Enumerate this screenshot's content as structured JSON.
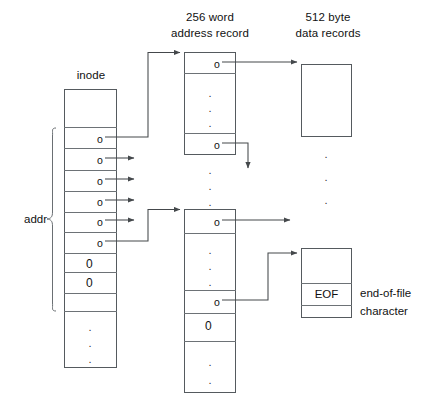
{
  "diagram": {
    "headers": {
      "inode": "inode",
      "address_record_line1": "256 word",
      "address_record_line2": "address record",
      "data_record_line1": "512 byte",
      "data_record_line2": "data records"
    },
    "annotations": {
      "addr_brace_label": "addr",
      "eof_cell": "EOF",
      "eof_note_line1": "end-of-file",
      "eof_note_line2": "character"
    },
    "symbols": {
      "pointer": "o",
      "null_pointer": "0",
      "dot": "."
    },
    "inode": {
      "name": "inode",
      "cells": [
        {
          "value": "",
          "type": "empty"
        },
        {
          "value": "o",
          "type": "pointer"
        },
        {
          "value": "o",
          "type": "pointer"
        },
        {
          "value": "o",
          "type": "pointer"
        },
        {
          "value": "o",
          "type": "pointer"
        },
        {
          "value": "o",
          "type": "pointer"
        },
        {
          "value": "o",
          "type": "pointer"
        },
        {
          "value": "0",
          "type": "null"
        },
        {
          "value": "0",
          "type": "null"
        },
        {
          "value": "...",
          "type": "ellipsis"
        }
      ]
    },
    "address_record_1": {
      "name": "256 word address record",
      "cells": [
        {
          "value": "o",
          "type": "pointer"
        },
        {
          "value": "...",
          "type": "ellipsis"
        },
        {
          "value": "o",
          "type": "pointer"
        }
      ]
    },
    "address_record_2": {
      "name": "256 word address record",
      "cells": [
        {
          "value": "o",
          "type": "pointer"
        },
        {
          "value": "...",
          "type": "ellipsis"
        },
        {
          "value": "o",
          "type": "pointer"
        },
        {
          "value": "0",
          "type": "null"
        },
        {
          "value": "...",
          "type": "ellipsis"
        }
      ]
    },
    "data_record_1": {
      "name": "512 byte data record",
      "cells": [
        {
          "value": "",
          "type": "empty"
        }
      ]
    },
    "data_record_eof": {
      "name": "512 byte data record with EOF",
      "cells": [
        {
          "value": "",
          "type": "empty"
        },
        {
          "value": "EOF",
          "type": "text"
        },
        {
          "value": "",
          "type": "empty"
        }
      ]
    },
    "colors": {
      "stroke": "#555a5e",
      "divider": "#6d7276",
      "text": "#111111",
      "background": "#ffffff"
    }
  }
}
